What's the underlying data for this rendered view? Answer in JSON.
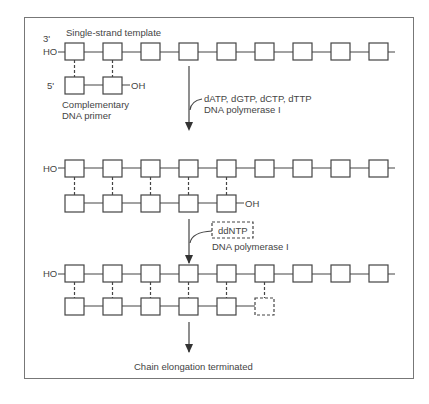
{
  "diagram": {
    "stage1": {
      "title": "Single-strand template",
      "end_3prime": "3'",
      "end_HO": "HO",
      "end_5prime": "5'",
      "primer_OH": "OH",
      "primer_label_line1": "Complementary",
      "primer_label_line2": "DNA primer",
      "template_box_count": 9,
      "primer_box_count": 2
    },
    "step1": {
      "reagents": "dATP, dGTP, dCTP, dTTP",
      "enzyme": "DNA polymerase I"
    },
    "stage2": {
      "end_HO": "HO",
      "end_OH": "OH",
      "template_box_count": 9,
      "complement_box_count": 5
    },
    "step2": {
      "reagent": "ddNTP",
      "enzyme": "DNA polymerase I"
    },
    "stage3": {
      "end_HO": "HO",
      "template_box_count": 9,
      "complement_box_count": 5,
      "terminator_box": "dashed",
      "result": "Chain elongation terminated"
    }
  }
}
